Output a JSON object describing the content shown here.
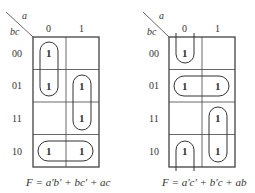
{
  "maps": [
    {
      "id": "left",
      "col_var": "a",
      "row_var": "bc",
      "col_headers": [
        "0",
        "1"
      ],
      "row_headers": [
        "00",
        "01",
        "11",
        "10"
      ],
      "cells": [
        [
          "1",
          ""
        ],
        [
          "1",
          "1"
        ],
        [
          "",
          "1"
        ],
        [
          "1",
          "1"
        ]
      ],
      "equation": "F = a′b′ + bc′ + ac"
    },
    {
      "id": "right",
      "col_var": "a",
      "row_var": "bc",
      "col_headers": [
        "0",
        "1"
      ],
      "row_headers": [
        "00",
        "01",
        "11",
        "10"
      ],
      "cells": [
        [
          "1",
          ""
        ],
        [
          "1",
          "1"
        ],
        [
          "",
          "1"
        ],
        [
          "1",
          "1"
        ]
      ],
      "equation": "F = a′c′ + b′c + ab"
    }
  ],
  "colors": {
    "line": "#333333",
    "background": "#ffffff"
  }
}
